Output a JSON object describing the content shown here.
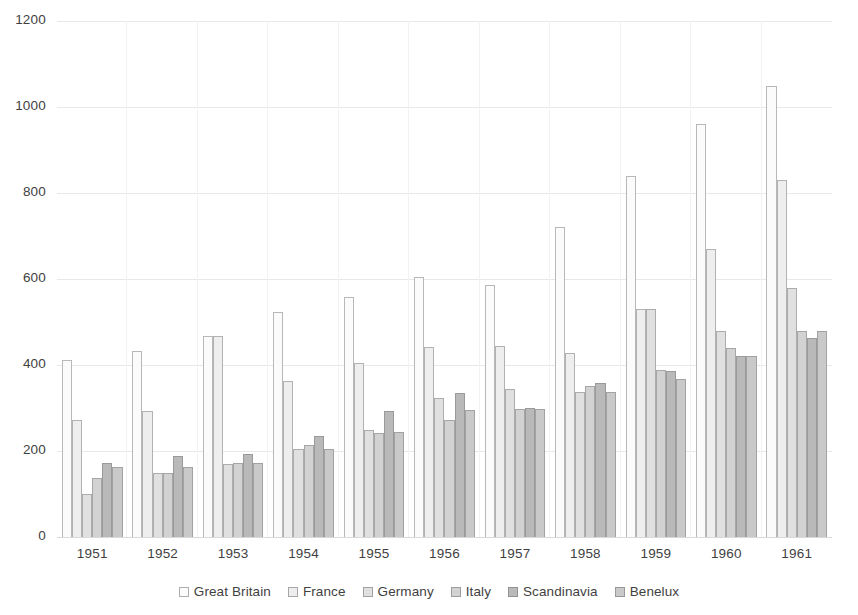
{
  "chart_data": {
    "type": "bar",
    "title": "",
    "subtitle": "",
    "xlabel": "",
    "ylabel": "",
    "ylim": [
      0,
      1200
    ],
    "ytick_labels": [
      "1200",
      "1000",
      "800",
      "600",
      "400",
      "200",
      "0"
    ],
    "yticks": [
      1200,
      1000,
      800,
      600,
      400,
      200,
      0
    ],
    "grid": true,
    "legend_position": "bottom",
    "categories": [
      "1951",
      "1952",
      "1953",
      "1954",
      "1955",
      "1956",
      "1957",
      "1958",
      "1959",
      "1960",
      "1961"
    ],
    "series": [
      {
        "name": "Great Britain",
        "color": "#fbfbfb",
        "values": [
          412,
          432,
          468,
          524,
          558,
          604,
          586,
          720,
          840,
          960,
          1050
        ]
      },
      {
        "name": "France",
        "color": "#eeeeee",
        "values": [
          272,
          292,
          468,
          362,
          404,
          442,
          444,
          428,
          530,
          670,
          830
        ]
      },
      {
        "name": "Germany",
        "color": "#e0e0e0",
        "values": [
          100,
          148,
          170,
          204,
          250,
          324,
          344,
          338,
          530,
          480,
          580
        ]
      },
      {
        "name": "Italy",
        "color": "#d2d2d2",
        "values": [
          138,
          150,
          172,
          214,
          242,
          272,
          298,
          352,
          388,
          440,
          478
        ]
      },
      {
        "name": "Scandinavia",
        "color": "#b9b9b9",
        "values": [
          172,
          188,
          192,
          234,
          294,
          336,
          300,
          358,
          386,
          420,
          462
        ]
      },
      {
        "name": "Benelux",
        "color": "#c9c9c9",
        "values": [
          162,
          162,
          172,
          204,
          244,
          296,
          298,
          338,
          368,
          420,
          480
        ]
      }
    ]
  }
}
